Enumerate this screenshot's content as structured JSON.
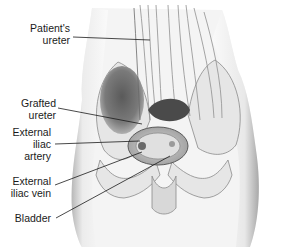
{
  "figure": {
    "style": "grayscale pencil illustration",
    "labels": [
      {
        "id": "patients-ureter",
        "lines": [
          "Patient's",
          "ureter"
        ]
      },
      {
        "id": "grafted-ureter",
        "lines": [
          "Grafted",
          "ureter"
        ]
      },
      {
        "id": "external-iliac-artery",
        "lines": [
          "External",
          "iliac",
          "artery"
        ]
      },
      {
        "id": "external-iliac-vein",
        "lines": [
          "External",
          "iliac vein"
        ]
      },
      {
        "id": "bladder",
        "lines": [
          "Bladder"
        ]
      }
    ]
  }
}
